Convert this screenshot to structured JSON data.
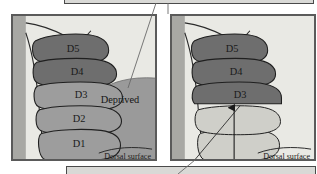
{
  "figure": {
    "title_visible": false,
    "type": "two-panel anatomical diagram of a monkey hand dorsal surface with digit regions",
    "colors": {
      "panel_background": "#e9e9e4",
      "panel_border": "#5a5a5a",
      "dark_digit": "#6e6e6e",
      "mid_digit": "#9d9d9d",
      "light_digit": "#cfcfc9",
      "deprived_band": "#9a9a9a",
      "forearm_shade": "#a8a8a4",
      "ghost_frame": "#d9d9d6",
      "line": "#2a2a2a",
      "text": "#1a1a1a"
    }
  },
  "panels": [
    {
      "id": "left",
      "name": "left-panel",
      "digits": [
        {
          "id": "D5",
          "label": "D5",
          "shade": "dark"
        },
        {
          "id": "D4",
          "label": "D4",
          "shade": "dark"
        },
        {
          "id": "D3",
          "label": "D3",
          "shade": "mid"
        },
        {
          "id": "D2",
          "label": "D2",
          "shade": "mid"
        },
        {
          "id": "D1",
          "label": "D1",
          "shade": "mid"
        }
      ],
      "annotations": {
        "deprived": "Deprived",
        "dorsal_surface": "Dorsal surface"
      }
    },
    {
      "id": "right",
      "name": "right-panel",
      "digits": [
        {
          "id": "D5",
          "label": "D5",
          "shade": "dark"
        },
        {
          "id": "D4",
          "label": "D4",
          "shade": "dark"
        },
        {
          "id": "D3",
          "label": "D3",
          "shade": "dark"
        },
        {
          "id": "D2",
          "label": "",
          "shade": "light"
        },
        {
          "id": "D1",
          "label": "",
          "shade": "light"
        }
      ],
      "annotations": {
        "dorsal_surface": "Dorsal surface",
        "arrow": "up-arrow-to-D3"
      }
    }
  ]
}
